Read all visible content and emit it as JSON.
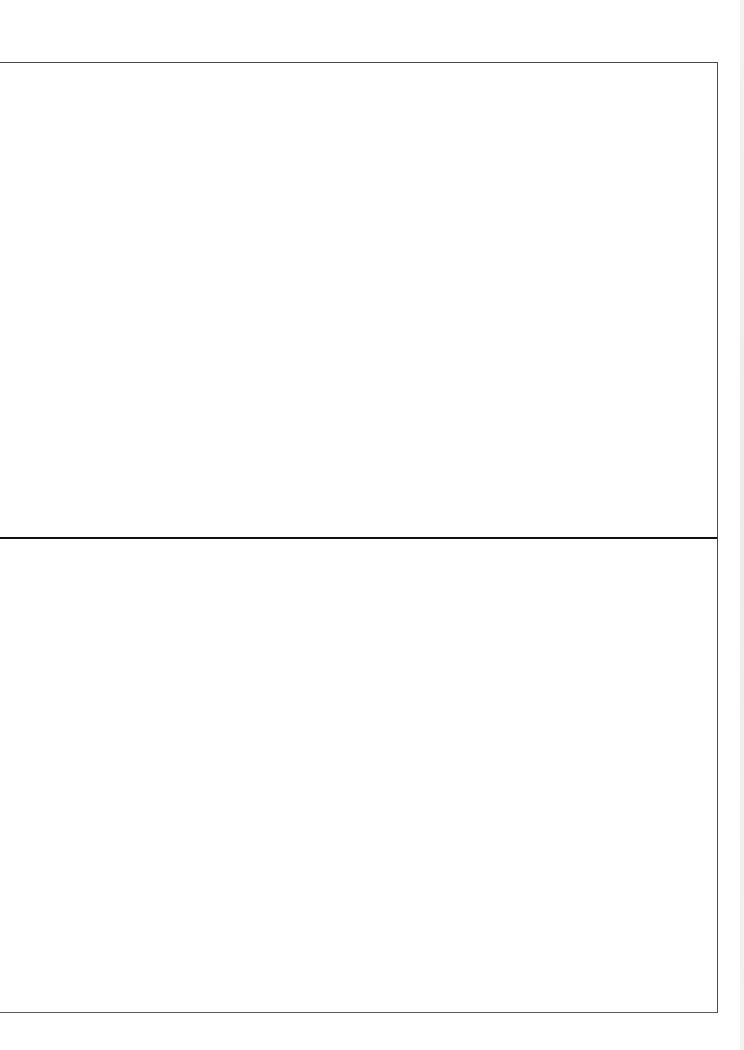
{
  "page": {
    "type": "scanned-blank-form",
    "panels": [
      {
        "id": "top-panel",
        "text": ""
      },
      {
        "id": "bottom-panel",
        "text": ""
      }
    ],
    "colors": {
      "border": "#4a4a4a",
      "divider": "#111111",
      "background": "#ffffff"
    }
  }
}
